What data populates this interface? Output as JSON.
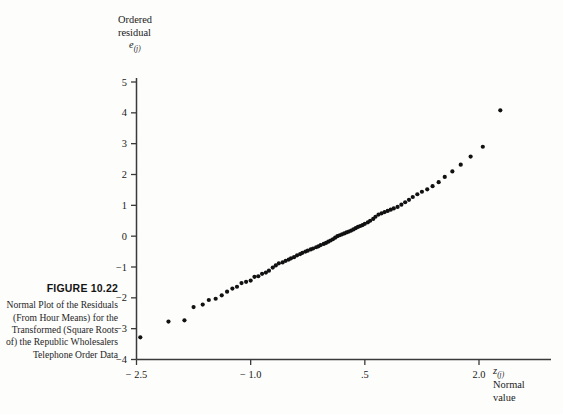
{
  "figure": {
    "label": "FIGURE 10.22",
    "description": "Normal Plot of the Residuals (From Hour Means) for the Transformed (Square Roots of) the Republic Wholesalers Telephone Order Data"
  },
  "axes": {
    "y_title_line1": "Ordered",
    "y_title_line2": "residual",
    "y_symbol_base": "e",
    "y_symbol_sub": "(j)",
    "x_symbol_base": "z",
    "x_symbol_sub": "(j)",
    "x_title_line1": "Normal",
    "x_title_line2": "value"
  },
  "style": {
    "point_color": "#111111",
    "axis_color": "#3a3a3a",
    "background": "#fdfdfc",
    "point_radius": 2.1
  },
  "chart_data": {
    "type": "scatter",
    "title": "Normal Plot of the Residuals (From Hour Means) for the Transformed (Square Roots of) the Republic Wholesalers Telephone Order Data",
    "xlabel": "z (j)  Normal value",
    "ylabel": "Ordered residual e (j)",
    "xlim": [
      -2.85,
      2.55
    ],
    "ylim": [
      -4.0,
      5.0
    ],
    "xticks": [
      -2.5,
      -1.0,
      0.5,
      2.0
    ],
    "xticklabels": [
      "-2.5",
      "-1.0",
      ".5",
      "2.0"
    ],
    "yticks": [
      -4,
      -3,
      -2,
      -1,
      0,
      1,
      2,
      3,
      4,
      5
    ],
    "yticklabels": [
      "-4",
      "-3",
      "-2",
      "-1",
      "0",
      "1",
      "2",
      "3",
      "4",
      "5"
    ],
    "grid": false,
    "legend": null,
    "series": [
      {
        "name": "ordered residuals vs normal scores",
        "x": [
          -2.45,
          -2.08,
          -1.87,
          -1.75,
          -1.63,
          -1.55,
          -1.46,
          -1.38,
          -1.31,
          -1.24,
          -1.18,
          -1.12,
          -1.06,
          -1.0,
          -0.95,
          -0.9,
          -0.85,
          -0.8,
          -0.76,
          -0.71,
          -0.67,
          -0.63,
          -0.58,
          -0.54,
          -0.5,
          -0.47,
          -0.43,
          -0.39,
          -0.35,
          -0.32,
          -0.28,
          -0.25,
          -0.21,
          -0.18,
          -0.14,
          -0.11,
          -0.08,
          -0.04,
          -0.01,
          0.02,
          0.05,
          0.08,
          0.11,
          0.14,
          0.17,
          0.2,
          0.23,
          0.26,
          0.29,
          0.32,
          0.35,
          0.38,
          0.41,
          0.44,
          0.47,
          0.5,
          0.54,
          0.57,
          0.61,
          0.64,
          0.68,
          0.72,
          0.76,
          0.8,
          0.84,
          0.88,
          0.93,
          0.98,
          1.03,
          1.08,
          1.13,
          1.19,
          1.25,
          1.32,
          1.39,
          1.47,
          1.55,
          1.65,
          1.76,
          1.89,
          2.05,
          2.28
        ],
        "y": [
          -3.28,
          -2.77,
          -2.73,
          -2.3,
          -2.22,
          -2.07,
          -2.03,
          -1.92,
          -1.8,
          -1.7,
          -1.64,
          -1.52,
          -1.48,
          -1.44,
          -1.32,
          -1.3,
          -1.22,
          -1.18,
          -1.12,
          -1.02,
          -0.95,
          -0.88,
          -0.85,
          -0.8,
          -0.76,
          -0.72,
          -0.68,
          -0.62,
          -0.58,
          -0.54,
          -0.5,
          -0.47,
          -0.43,
          -0.4,
          -0.36,
          -0.33,
          -0.29,
          -0.25,
          -0.22,
          -0.18,
          -0.14,
          -0.1,
          -0.05,
          0.0,
          0.03,
          0.06,
          0.09,
          0.12,
          0.15,
          0.18,
          0.22,
          0.26,
          0.3,
          0.33,
          0.36,
          0.4,
          0.45,
          0.5,
          0.56,
          0.63,
          0.7,
          0.74,
          0.78,
          0.82,
          0.86,
          0.9,
          0.95,
          1.02,
          1.1,
          1.18,
          1.27,
          1.36,
          1.44,
          1.52,
          1.62,
          1.75,
          1.92,
          2.1,
          2.32,
          2.58,
          2.9,
          4.08
        ]
      }
    ]
  }
}
